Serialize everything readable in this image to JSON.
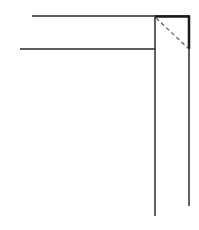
{
  "diagram": {
    "stroke_color": "#2a2a2a",
    "background": "#ffffff",
    "lines": {
      "top_horizontal": {
        "x1": 32,
        "y1": 16,
        "x2": 190,
        "y2": 16
      },
      "middle_horizontal": {
        "x1": 20,
        "y1": 49,
        "x2": 155,
        "y2": 49
      },
      "left_vertical": {
        "x1": 155,
        "y1": 17,
        "x2": 155,
        "y2": 216
      },
      "right_vertical": {
        "x1": 189,
        "y1": 16,
        "x2": 189,
        "y2": 206
      },
      "miter_dashed": {
        "x1": 156,
        "y1": 18,
        "x2": 189,
        "y2": 49
      }
    }
  }
}
